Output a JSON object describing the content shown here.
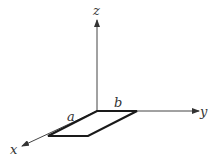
{
  "diagram": {
    "type": "3d-axes-with-rectangle",
    "axes": {
      "x": {
        "label": "x"
      },
      "y": {
        "label": "y"
      },
      "z": {
        "label": "z"
      }
    },
    "rectangle": {
      "plane": "xy",
      "side_along_x": {
        "label": "a"
      },
      "side_along_y": {
        "label": "b"
      }
    },
    "colors": {
      "axis": "#444444",
      "rectangle_edge": "#1a1a1a",
      "background": "#ffffff"
    }
  }
}
